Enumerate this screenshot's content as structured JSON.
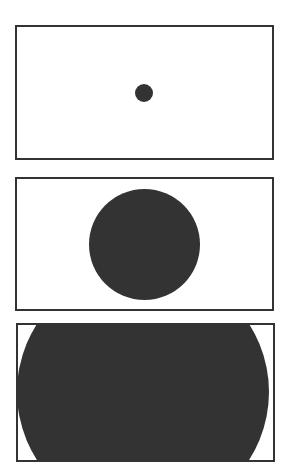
{
  "figure": {
    "title": "",
    "caption": "",
    "background_color": "#ffffff",
    "width": 289,
    "height": 474,
    "border_color": "#333333",
    "shape_color": "#333333"
  },
  "chart_data": {
    "type": "scatter",
    "xlabel": "",
    "ylabel": "",
    "grid": false,
    "legend_position": "none",
    "panel_frame": {
      "border_color": "#333333",
      "border_width_px": 2,
      "fill_color": "#ffffff"
    },
    "categories": [
      "panel-1",
      "panel-2",
      "panel-3"
    ],
    "values": [
      18,
      111,
      252
    ],
    "value_label": "circle diameter (px)",
    "series": [
      {
        "name": "circle diameter (px)",
        "values": [
          18,
          111,
          252
        ]
      },
      {
        "name": "circle radius (px)",
        "values": [
          9,
          55.5,
          126
        ]
      }
    ],
    "panels": [
      {
        "id": "panel-1",
        "index": 1,
        "label": "small circle",
        "frame": {
          "x": 15,
          "y": 25,
          "width": 259,
          "height": 135
        },
        "circle": {
          "cx": 144,
          "cy": 93,
          "diameter": 18,
          "color": "#333333",
          "clipped": false
        }
      },
      {
        "id": "panel-2",
        "index": 2,
        "label": "medium circle",
        "frame": {
          "x": 15,
          "y": 177,
          "width": 259,
          "height": 134
        },
        "circle": {
          "cx": 144,
          "cy": 244,
          "diameter": 111,
          "color": "#333333",
          "clipped": false
        }
      },
      {
        "id": "panel-3",
        "index": 3,
        "label": "large clipped circle",
        "frame": {
          "x": 16,
          "y": 323,
          "width": 259,
          "height": 139
        },
        "circle": {
          "cx": 143,
          "cy": 392,
          "diameter": 252,
          "color": "#333333",
          "clipped": true
        }
      }
    ]
  }
}
